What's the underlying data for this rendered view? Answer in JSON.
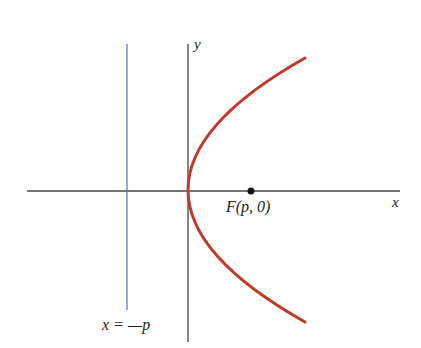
{
  "diagram": {
    "axes": {
      "x_label": "x",
      "y_label": "y"
    },
    "focus": {
      "label": "F(p, 0)"
    },
    "directrix": {
      "label": "x = —p"
    },
    "colors": {
      "parabola": "#c0392b",
      "directrix": "#5b7fc4",
      "axes": "#333333",
      "focus": "#111111"
    }
  }
}
